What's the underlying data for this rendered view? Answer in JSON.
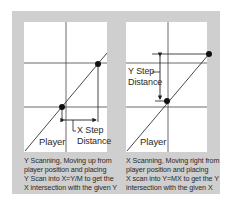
{
  "diagrams": [
    {
      "id": "y-scanning",
      "player_label": "Player",
      "step_label_line1": "X Step",
      "step_label_line2": "Distance",
      "caption": [
        "Y Scanning, Moving up from",
        "player position and placing",
        "Y Scan into X=Y/M to get the",
        "X intersection with the given Y"
      ]
    },
    {
      "id": "x-scanning",
      "player_label": "Player",
      "step_label_line1": "Y Step",
      "step_label_line2": "Distance",
      "caption": [
        "X Scanning, Moving right from",
        "player position and placing",
        "X scan into Y=MX to get the Y",
        "intersection with the given X"
      ]
    }
  ],
  "colors": {
    "frame": "#cfcfcf",
    "panel": "#ffffff",
    "line": "#333333",
    "dot": "#111111"
  }
}
